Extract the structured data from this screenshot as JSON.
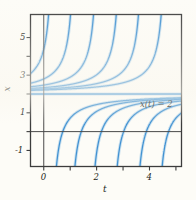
{
  "figure": {
    "kind": "phase-plot",
    "colors": {
      "curve": "#3d8fd1",
      "curve_light": "#7fb9e3",
      "axis": "#4a4a4a",
      "frame": "#3c3c3c",
      "text": "#231f20",
      "background": "#fdfcf7"
    }
  },
  "annotations": [
    {
      "name": "equilibrium-label",
      "text": "x(t) = 2",
      "x": 140,
      "y": 99
    }
  ],
  "axes": {
    "x_axis_label": "t",
    "y_axis_label": "x",
    "x_ticks": [
      {
        "value": 0,
        "label": "0"
      },
      {
        "value": 1,
        "label": ""
      },
      {
        "value": 2,
        "label": "2"
      },
      {
        "value": 3,
        "label": ""
      },
      {
        "value": 4,
        "label": "4"
      },
      {
        "value": 5,
        "label": ""
      }
    ],
    "y_ticks": [
      {
        "value": 5,
        "label": "5"
      },
      {
        "value": 4,
        "label": ""
      },
      {
        "value": 3,
        "label": "3"
      },
      {
        "value": 2,
        "label": ""
      },
      {
        "value": 1,
        "label": "1"
      },
      {
        "value": 0,
        "label": ""
      },
      {
        "value": -1,
        "label": "-1"
      }
    ],
    "xlim": [
      -0.52,
      5.23
    ],
    "ylim": [
      -1.88,
      6.25
    ],
    "grid": false
  },
  "chart_data": {
    "type": "line",
    "title": "",
    "xlabel": "t",
    "ylabel": "x",
    "xlim": [
      -0.52,
      5.23
    ],
    "ylim": [
      -1.88,
      6.25
    ],
    "grid": false,
    "legend_position": "none",
    "annotations": [
      "x(t) = 2"
    ],
    "equilibria": [
      {
        "value": 2,
        "label": "x(t) = 2",
        "stability": "unstable"
      }
    ],
    "series": [
      {
        "name": "x(t) = 2 (equilibrium)",
        "branch": "equilibrium",
        "asymptote_t": null,
        "x_at_t0": 2
      },
      {
        "name": "above-1",
        "branch": "above",
        "asymptote_t": -0.38,
        "x_at_t0": 2.95
      },
      {
        "name": "above-2",
        "branch": "above",
        "asymptote_t": 0.42,
        "x_at_t0": 6.25
      },
      {
        "name": "above-3",
        "branch": "above",
        "asymptote_t": 1.25,
        "x_at_t0": null
      },
      {
        "name": "above-4",
        "branch": "above",
        "asymptote_t": 2.12,
        "x_at_t0": null
      },
      {
        "name": "above-5",
        "branch": "above",
        "asymptote_t": 2.98,
        "x_at_t0": null
      },
      {
        "name": "above-6",
        "branch": "above",
        "asymptote_t": 3.82,
        "x_at_t0": null
      },
      {
        "name": "above-7",
        "branch": "above",
        "asymptote_t": 4.68,
        "x_at_t0": null
      },
      {
        "name": "below-1",
        "branch": "below",
        "asymptote_t": 0.22,
        "x_at_t0": 1.02
      },
      {
        "name": "below-2",
        "branch": "below",
        "asymptote_t": 0.92,
        "x_at_t0": 1.62
      },
      {
        "name": "below-3",
        "branch": "below",
        "asymptote_t": 1.68,
        "x_at_t0": 1.8
      },
      {
        "name": "below-4",
        "branch": "below",
        "asymptote_t": 2.52,
        "x_at_t0": 1.9
      },
      {
        "name": "below-5",
        "branch": "below",
        "asymptote_t": 3.38,
        "x_at_t0": 1.95
      },
      {
        "name": "below-6",
        "branch": "below",
        "asymptote_t": 4.22,
        "x_at_t0": 1.97
      },
      {
        "name": "below-7",
        "branch": "below",
        "asymptote_t": 5.05,
        "x_at_t0": 1.99
      }
    ]
  }
}
